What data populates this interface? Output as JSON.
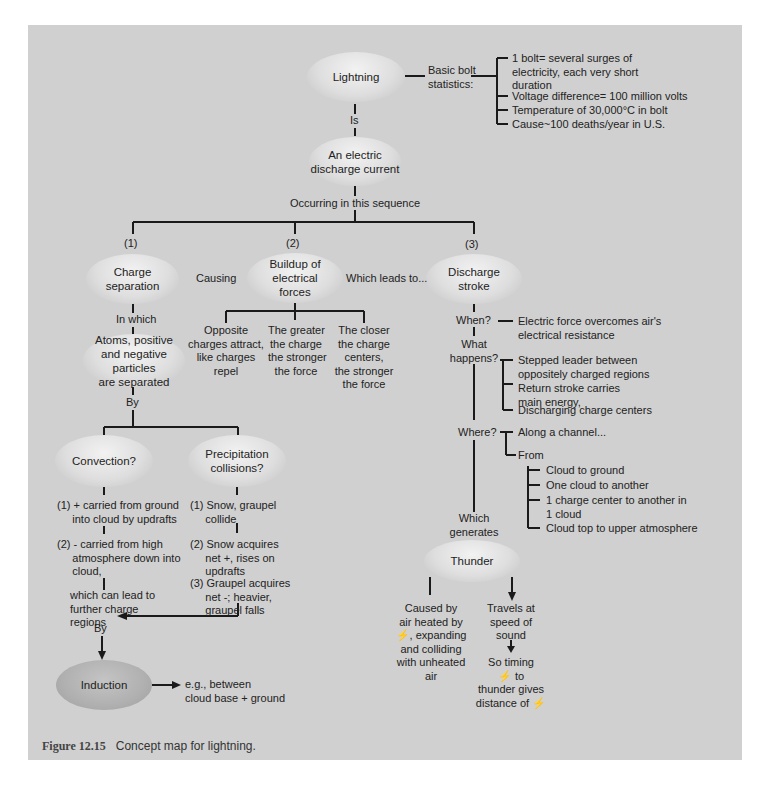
{
  "figure": {
    "label": "Figure 12.15",
    "caption": "Concept map for lightning."
  },
  "nodes": {
    "lightning": "Lightning",
    "discharge_current": [
      "An electric",
      "discharge current"
    ],
    "charge_separation": [
      "Charge",
      "separation"
    ],
    "buildup": [
      "Buildup of",
      "electrical",
      "forces"
    ],
    "discharge_stroke": [
      "Discharge",
      "stroke"
    ],
    "atoms": [
      "Atoms, positive",
      "and negative particles",
      "are separated"
    ],
    "convection": "Convection?",
    "precipitation": [
      "Precipitation",
      "collisions?"
    ],
    "induction": "Induction",
    "thunder": "Thunder"
  },
  "links": {
    "basic_bolt": [
      "Basic bolt",
      "statistics:"
    ],
    "is": "Is",
    "sequence": "Occurring in this sequence",
    "step1": "(1)",
    "step2": "(2)",
    "step3": "(3)",
    "causing": "Causing",
    "leads_to": "Which leads to...",
    "in_which": "In which",
    "by1": "By",
    "by2": "By",
    "when": "When?",
    "what_happens": [
      "What",
      "happens?"
    ],
    "where": "Where?",
    "from": "From",
    "which_generates": [
      "Which",
      "generates"
    ]
  },
  "bolt_stats": [
    [
      "1 bolt= several surges of",
      "electricity, each very short",
      "duration"
    ],
    [
      "Voltage difference= 100 million volts"
    ],
    [
      "Temperature of 30,000°C in bolt"
    ],
    [
      "Cause~100 deaths/year in U.S."
    ]
  ],
  "forces": [
    [
      "Opposite",
      "charges attract,",
      "like charges",
      "repel"
    ],
    [
      "The greater",
      "the charge",
      "the stronger",
      "the force"
    ],
    [
      "The closer",
      "the charge",
      "centers,",
      "the stronger",
      "the force"
    ]
  ],
  "when_text": [
    "Electric force overcomes air's",
    "electrical resistance"
  ],
  "what_happens_items": [
    [
      "Stepped leader between",
      "oppositely charged regions"
    ],
    [
      "Return stroke carries",
      "main energy,"
    ],
    [
      "Discharging charge centers"
    ]
  ],
  "where_text": "Along a channel...",
  "from_items": [
    [
      "Cloud to ground"
    ],
    [
      "One cloud to another"
    ],
    [
      "1 charge center to another in",
      "1 cloud"
    ],
    [
      "Cloud top to upper atmosphere"
    ]
  ],
  "convection_steps": [
    [
      "(1) + carried from ground",
      "     into cloud by updrafts"
    ],
    [
      "(2) - carried from high",
      "     atmosphere down into",
      "     cloud,"
    ],
    [
      "which can lead to",
      "further charge",
      "regions"
    ]
  ],
  "precipitation_steps": [
    [
      "(1) Snow, graupel",
      "     collide"
    ],
    [
      "(2) Snow acquires",
      "     net +, rises on",
      "     updrafts"
    ],
    [
      "(3) Graupel acquires",
      "     net -; heavier,",
      "     graupel falls"
    ]
  ],
  "induction_text": [
    "e.g., between",
    "cloud base + ground"
  ],
  "thunder_cause": [
    "Caused by",
    "air heated by",
    "⚡, expanding",
    "and colliding",
    "with unheated",
    "air"
  ],
  "thunder_travel": [
    "Travels at",
    "speed of",
    "sound"
  ],
  "thunder_timing": [
    "So timing",
    "⚡ to",
    "thunder gives",
    "distance of ⚡"
  ],
  "colors": {
    "panel": "#d0d0d0",
    "line": "#1a1a1a",
    "node_light": "#e6e6e6",
    "node_dark": "#b0b0b0"
  }
}
